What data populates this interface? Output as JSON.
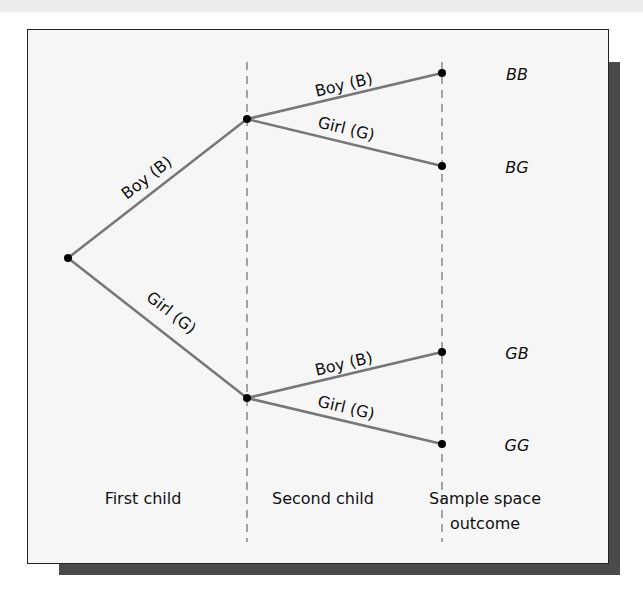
{
  "diagram": {
    "type": "tree",
    "stages": [
      {
        "label": "First child",
        "x": 143
      },
      {
        "label": "Second child",
        "x": 323
      },
      {
        "label_line1": "Sample space",
        "label_line2": "outcome",
        "x": 485
      }
    ],
    "branches": {
      "first_boy": "Boy (B)",
      "first_girl": "Girl (G)",
      "second_boy_upper": "Boy (B)",
      "second_girl_upper": "Girl (G)",
      "second_boy_lower": "Boy (B)",
      "second_girl_lower": "Girl (G)"
    },
    "outcomes": [
      "BB",
      "BG",
      "GB",
      "GG"
    ],
    "colors": {
      "branch": "#777777",
      "node": "#000000",
      "divider": "#888888",
      "frame_border": "#222222",
      "shadow": "#4a4a4a"
    }
  }
}
